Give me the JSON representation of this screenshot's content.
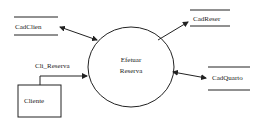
{
  "diagram": {
    "type": "data-flow-diagram",
    "process": {
      "line1": "Efetuar",
      "line2": "Reserva"
    },
    "data_stores": [
      {
        "id": "cadclien",
        "label": "CadClien"
      },
      {
        "id": "cadreser",
        "label": "CadReser"
      },
      {
        "id": "cadquarto",
        "label": "CadQuarto"
      }
    ],
    "external_entity": {
      "label": "Cliente"
    },
    "flows": [
      {
        "from": "CadClien",
        "to": "Efetuar Reserva",
        "direction": "bidirectional",
        "label": ""
      },
      {
        "from": "Efetuar Reserva",
        "to": "CadReser",
        "direction": "forward",
        "label": ""
      },
      {
        "from": "Efetuar Reserva",
        "to": "CadQuarto",
        "direction": "bidirectional",
        "label": ""
      },
      {
        "from": "Cliente",
        "to": "Efetuar Reserva",
        "direction": "forward",
        "label": "Cli_Reserva"
      }
    ],
    "colors": {
      "line": "#222222",
      "background": "#ffffff"
    }
  }
}
